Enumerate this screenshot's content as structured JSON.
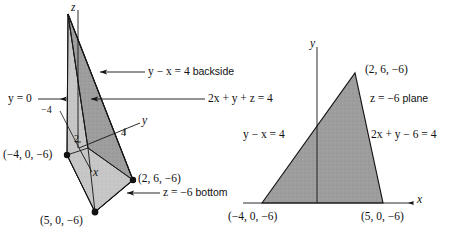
{
  "figure": {
    "type": "math-diagram",
    "background_color": "#ffffff",
    "ink_color": "#111111",
    "shade_dark": "#9a9a9a",
    "shade_light": "#c9c9c9",
    "vertex_dot_color": "#111111"
  },
  "left_panel": {
    "name": "three-dimensional-solid",
    "axes": [
      {
        "id": "z",
        "label": "z"
      },
      {
        "id": "y",
        "label": "y"
      },
      {
        "id": "x",
        "label": "x"
      }
    ],
    "tick_labels": [
      {
        "id": "minus-four",
        "text": "−4"
      },
      {
        "id": "two",
        "text": "2"
      },
      {
        "id": "four",
        "text": "4"
      }
    ],
    "surface_labels": [
      {
        "id": "backside",
        "text": "y − x = 4 backside",
        "math": "y − x = 4",
        "suffix": "backside",
        "arrow": "left"
      },
      {
        "id": "slant-plane",
        "text": "2x + y + z = 4",
        "math": "2x + y + z = 4",
        "suffix": "",
        "arrow": "left"
      },
      {
        "id": "y-equals-zero",
        "text": "y = 0",
        "math": "y = 0",
        "suffix": "",
        "arrow": "right"
      },
      {
        "id": "bottom",
        "text": "z = −6 bottom",
        "math": "z = −6",
        "suffix": "bottom",
        "arrow": "left"
      }
    ],
    "vertices": [
      {
        "id": "vertex-a",
        "text": "(−4, 0, −6)"
      },
      {
        "id": "vertex-b",
        "text": "(2, 6, −6)"
      },
      {
        "id": "vertex-c",
        "text": "(5, 0, −6)"
      }
    ]
  },
  "right_panel": {
    "name": "cross-section-triangle",
    "axes": [
      {
        "id": "y",
        "label": "y"
      },
      {
        "id": "x",
        "label": "x"
      }
    ],
    "plane_label": {
      "id": "plane",
      "text": "z = −6 plane",
      "math": "z = −6",
      "suffix": "plane"
    },
    "edge_labels": [
      {
        "id": "left-edge",
        "text": "y − x = 4"
      },
      {
        "id": "right-edge",
        "text": "2x + y − 6 = 4"
      }
    ],
    "vertices": [
      {
        "id": "apex",
        "text": "(2, 6, −6)"
      },
      {
        "id": "bottom-left",
        "text": "(−4, 0, −6)"
      },
      {
        "id": "bottom-right",
        "text": "(5, 0, −6)"
      }
    ]
  }
}
